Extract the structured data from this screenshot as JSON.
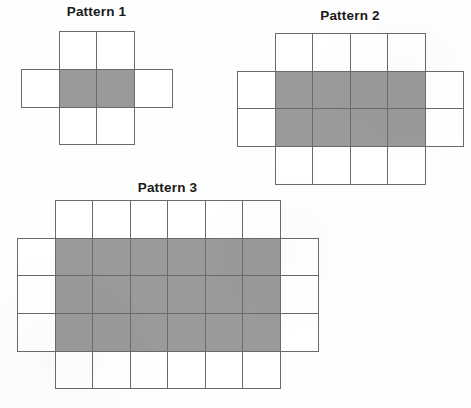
{
  "page": {
    "background_color": "#fefefe",
    "width": 471,
    "height": 408
  },
  "style": {
    "shaded_fill": "#9a9a9a",
    "unshaded_fill": "#ffffff",
    "stroke_color": "#6a6a6a",
    "title_color": "#1a1a1a"
  },
  "patterns": [
    {
      "id": "pattern-1",
      "title": "Pattern 1",
      "cell_size": 37.5,
      "origin_x": 21,
      "origin_y": 31,
      "title_left": 21,
      "title_top": 4,
      "title_width": 151,
      "shaded_core": {
        "cols": 2,
        "rows": 1,
        "col_offset": 1,
        "row_offset": 1
      },
      "total_cols": 4,
      "total_rows": 3,
      "shaded_count": 2,
      "unshaded_count": 6,
      "total_count": 8,
      "cells": [
        {
          "col": 1,
          "row": 0,
          "shaded": false
        },
        {
          "col": 2,
          "row": 0,
          "shaded": false
        },
        {
          "col": 0,
          "row": 1,
          "shaded": false
        },
        {
          "col": 1,
          "row": 1,
          "shaded": true
        },
        {
          "col": 2,
          "row": 1,
          "shaded": true
        },
        {
          "col": 3,
          "row": 1,
          "shaded": false
        },
        {
          "col": 1,
          "row": 2,
          "shaded": false
        },
        {
          "col": 2,
          "row": 2,
          "shaded": false
        }
      ]
    },
    {
      "id": "pattern-2",
      "title": "Pattern 2",
      "cell_size": 37.5,
      "origin_x": 237,
      "origin_y": 33,
      "title_left": 237,
      "title_top": 8,
      "title_width": 226,
      "shaded_core": {
        "cols": 4,
        "rows": 2,
        "col_offset": 1,
        "row_offset": 1
      },
      "total_cols": 6,
      "total_rows": 4,
      "shaded_count": 8,
      "unshaded_count": 12,
      "total_count": 20,
      "cells": [
        {
          "col": 1,
          "row": 0,
          "shaded": false
        },
        {
          "col": 2,
          "row": 0,
          "shaded": false
        },
        {
          "col": 3,
          "row": 0,
          "shaded": false
        },
        {
          "col": 4,
          "row": 0,
          "shaded": false
        },
        {
          "col": 0,
          "row": 1,
          "shaded": false
        },
        {
          "col": 1,
          "row": 1,
          "shaded": true
        },
        {
          "col": 2,
          "row": 1,
          "shaded": true
        },
        {
          "col": 3,
          "row": 1,
          "shaded": true
        },
        {
          "col": 4,
          "row": 1,
          "shaded": true
        },
        {
          "col": 5,
          "row": 1,
          "shaded": false
        },
        {
          "col": 0,
          "row": 2,
          "shaded": false
        },
        {
          "col": 1,
          "row": 2,
          "shaded": true
        },
        {
          "col": 2,
          "row": 2,
          "shaded": true
        },
        {
          "col": 3,
          "row": 2,
          "shaded": true
        },
        {
          "col": 4,
          "row": 2,
          "shaded": true
        },
        {
          "col": 5,
          "row": 2,
          "shaded": false
        },
        {
          "col": 1,
          "row": 3,
          "shaded": false
        },
        {
          "col": 2,
          "row": 3,
          "shaded": false
        },
        {
          "col": 3,
          "row": 3,
          "shaded": false
        },
        {
          "col": 4,
          "row": 3,
          "shaded": false
        }
      ]
    },
    {
      "id": "pattern-3",
      "title": "Pattern 3",
      "cell_size": 37.5,
      "origin_x": 17,
      "origin_y": 200,
      "title_left": 17,
      "title_top": 180,
      "title_width": 301,
      "shaded_core": {
        "cols": 6,
        "rows": 3,
        "col_offset": 1,
        "row_offset": 1
      },
      "total_cols": 8,
      "total_rows": 5,
      "shaded_count": 18,
      "unshaded_count": 18,
      "total_count": 36,
      "cells": [
        {
          "col": 1,
          "row": 0,
          "shaded": false
        },
        {
          "col": 2,
          "row": 0,
          "shaded": false
        },
        {
          "col": 3,
          "row": 0,
          "shaded": false
        },
        {
          "col": 4,
          "row": 0,
          "shaded": false
        },
        {
          "col": 5,
          "row": 0,
          "shaded": false
        },
        {
          "col": 6,
          "row": 0,
          "shaded": false
        },
        {
          "col": 0,
          "row": 1,
          "shaded": false
        },
        {
          "col": 1,
          "row": 1,
          "shaded": true
        },
        {
          "col": 2,
          "row": 1,
          "shaded": true
        },
        {
          "col": 3,
          "row": 1,
          "shaded": true
        },
        {
          "col": 4,
          "row": 1,
          "shaded": true
        },
        {
          "col": 5,
          "row": 1,
          "shaded": true
        },
        {
          "col": 6,
          "row": 1,
          "shaded": true
        },
        {
          "col": 7,
          "row": 1,
          "shaded": false
        },
        {
          "col": 0,
          "row": 2,
          "shaded": false
        },
        {
          "col": 1,
          "row": 2,
          "shaded": true
        },
        {
          "col": 2,
          "row": 2,
          "shaded": true
        },
        {
          "col": 3,
          "row": 2,
          "shaded": true
        },
        {
          "col": 4,
          "row": 2,
          "shaded": true
        },
        {
          "col": 5,
          "row": 2,
          "shaded": true
        },
        {
          "col": 6,
          "row": 2,
          "shaded": true
        },
        {
          "col": 7,
          "row": 2,
          "shaded": false
        },
        {
          "col": 0,
          "row": 3,
          "shaded": false
        },
        {
          "col": 1,
          "row": 3,
          "shaded": true
        },
        {
          "col": 2,
          "row": 3,
          "shaded": true
        },
        {
          "col": 3,
          "row": 3,
          "shaded": true
        },
        {
          "col": 4,
          "row": 3,
          "shaded": true
        },
        {
          "col": 5,
          "row": 3,
          "shaded": true
        },
        {
          "col": 6,
          "row": 3,
          "shaded": true
        },
        {
          "col": 7,
          "row": 3,
          "shaded": false
        },
        {
          "col": 1,
          "row": 4,
          "shaded": false
        },
        {
          "col": 2,
          "row": 4,
          "shaded": false
        },
        {
          "col": 3,
          "row": 4,
          "shaded": false
        },
        {
          "col": 4,
          "row": 4,
          "shaded": false
        },
        {
          "col": 5,
          "row": 4,
          "shaded": false
        },
        {
          "col": 6,
          "row": 4,
          "shaded": false
        }
      ]
    }
  ]
}
